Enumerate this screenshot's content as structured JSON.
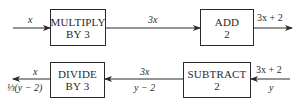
{
  "diagram": {
    "type": "flow",
    "top_row": {
      "input_label": "x",
      "box1": {
        "line1": "MULTIPLY",
        "line2": "BY 3"
      },
      "mid_label": "3x",
      "box2": {
        "line1": "ADD",
        "line2": "2"
      },
      "output_label": "3x + 2"
    },
    "bottom_row": {
      "input_label_top": "3x + 2",
      "input_label_bottom": "y",
      "box1": {
        "line1": "SUBTRACT",
        "line2": "2"
      },
      "mid_label_top": "3x",
      "mid_label_bottom": "y − 2",
      "box2": {
        "line1": "DIVIDE",
        "line2": "BY 3"
      },
      "output_label_top": "x",
      "output_label_bottom": "⅓(y − 2)"
    },
    "colors": {
      "line": "#2a2a2a",
      "background": "#ffffff"
    }
  }
}
